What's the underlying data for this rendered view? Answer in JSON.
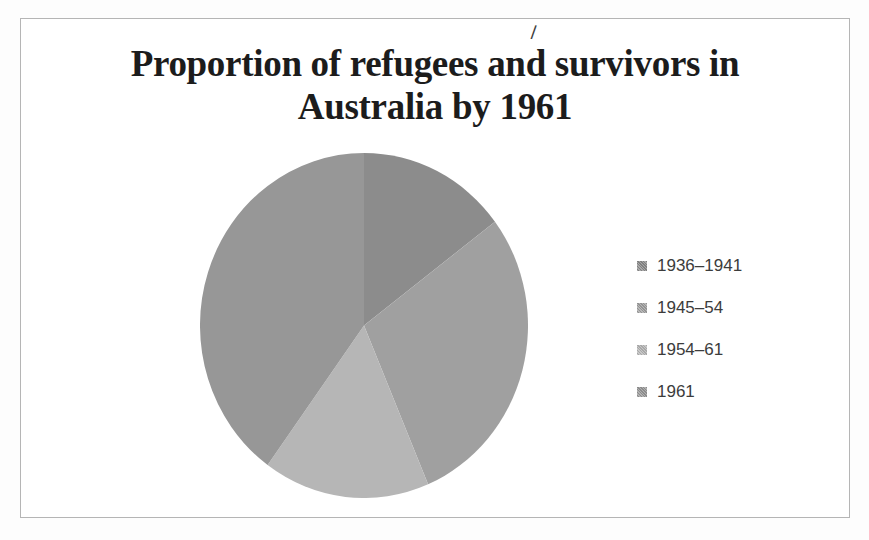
{
  "window": {
    "width_px": 869,
    "height_px": 540
  },
  "frame": {
    "border_color": "#b5b5b5",
    "background": "#ffffff"
  },
  "title": {
    "line1": "Proportion of refugees and survivors in",
    "line2": "Australia by 1961",
    "color": "#1c1c1c"
  },
  "stray_mark": {
    "glyph": "/"
  },
  "chart_data": {
    "type": "pie",
    "title": "Proportion of refugees and survivors in Australia by 1961",
    "legend_position": "right",
    "grid": false,
    "start_angle_deg": 0,
    "direction": "clockwise",
    "categories": [
      "1936–1941",
      "1945–54",
      "1954–61",
      "1961"
    ],
    "values_pct": [
      15,
      29,
      16,
      40
    ],
    "slices": [
      {
        "label": "1936–1941",
        "value_pct": 15,
        "start_deg": 0,
        "end_deg": 53,
        "color": "#8c8c8c"
      },
      {
        "label": "1945–54",
        "value_pct": 29,
        "start_deg": 53,
        "end_deg": 157,
        "color": "#a0a0a0"
      },
      {
        "label": "1954–61",
        "value_pct": 16,
        "start_deg": 157,
        "end_deg": 216,
        "color": "#b6b6b6"
      },
      {
        "label": "1961",
        "value_pct": 40,
        "start_deg": 216,
        "end_deg": 360,
        "color": "#979797"
      }
    ],
    "legend_text_color": "#3c3c3c"
  }
}
